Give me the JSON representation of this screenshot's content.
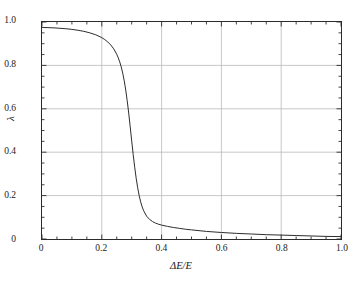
{
  "chart_data": {
    "type": "line",
    "title": "",
    "xlabel": "ΔE/E",
    "ylabel": "λ",
    "xlim": [
      0,
      1
    ],
    "ylim": [
      0,
      1
    ],
    "grid": true,
    "legend": null,
    "xticks": [
      "0",
      "0.2",
      "0.4",
      "0.6",
      "0.8",
      "1.0"
    ],
    "xtick_values": [
      0,
      0.2,
      0.4,
      0.6,
      0.8,
      1.0
    ],
    "yticks": [
      "0",
      "0.2",
      "0.4",
      "0.6",
      "0.8",
      "1.0"
    ],
    "ytick_values": [
      0,
      0.2,
      0.4,
      0.6,
      0.8,
      1.0
    ],
    "x_minor_step": 0.05,
    "y_minor_step": 0.05,
    "series": [
      {
        "name": "lambda",
        "color": "#2b2b2b",
        "linewidth": 1.0,
        "x": [
          0.0,
          0.02,
          0.04,
          0.06,
          0.08,
          0.1,
          0.12,
          0.14,
          0.16,
          0.18,
          0.2,
          0.21,
          0.22,
          0.23,
          0.24,
          0.25,
          0.255,
          0.26,
          0.265,
          0.27,
          0.275,
          0.28,
          0.285,
          0.29,
          0.295,
          0.3,
          0.305,
          0.31,
          0.315,
          0.32,
          0.325,
          0.33,
          0.335,
          0.34,
          0.35,
          0.36,
          0.37,
          0.38,
          0.39,
          0.4,
          0.42,
          0.44,
          0.46,
          0.48,
          0.5,
          0.55,
          0.6,
          0.65,
          0.7,
          0.75,
          0.8,
          0.85,
          0.9,
          0.95,
          1.0
        ],
        "y": [
          0.975,
          0.974,
          0.973,
          0.971,
          0.969,
          0.966,
          0.962,
          0.957,
          0.95,
          0.941,
          0.928,
          0.919,
          0.908,
          0.894,
          0.876,
          0.851,
          0.835,
          0.816,
          0.793,
          0.764,
          0.729,
          0.687,
          0.637,
          0.58,
          0.517,
          0.452,
          0.389,
          0.331,
          0.28,
          0.236,
          0.2,
          0.171,
          0.148,
          0.13,
          0.105,
          0.09,
          0.08,
          0.073,
          0.068,
          0.064,
          0.058,
          0.053,
          0.049,
          0.045,
          0.042,
          0.035,
          0.03,
          0.026,
          0.023,
          0.02,
          0.018,
          0.016,
          0.014,
          0.012,
          0.011
        ]
      }
    ],
    "colors": {
      "curve": "#2b2b2b",
      "axis": "#2b2b2b",
      "grid": "#b9b9b9",
      "background": "#ffffff",
      "text": "#1a1a1a"
    }
  }
}
